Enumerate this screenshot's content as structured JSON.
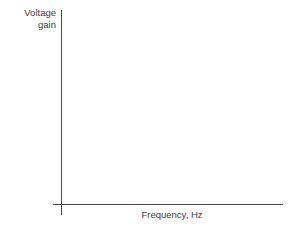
{
  "chart_data": {
    "type": "line",
    "title": "",
    "subtitle": "",
    "xlabel": "Frequency, Hz",
    "ylabel": "Voltage gain",
    "ylabel_lines": [
      "Voltage",
      "gain"
    ],
    "series": [],
    "categories": [],
    "x": [],
    "values": [],
    "xticks": [],
    "yticks": [],
    "xticklabels": [],
    "yticklabels": [],
    "grid": false,
    "legend": false,
    "legend_position": "none",
    "annotations": [],
    "axis_color": "#4a4a4a",
    "text_color": "#3c3c3c",
    "background_color": "#ffffff",
    "note": "Empty axis pair: vertical axis labelled Voltage gain, horizontal axis labelled Frequency, Hz; no data plotted, no tick marks, no numeric scale."
  }
}
